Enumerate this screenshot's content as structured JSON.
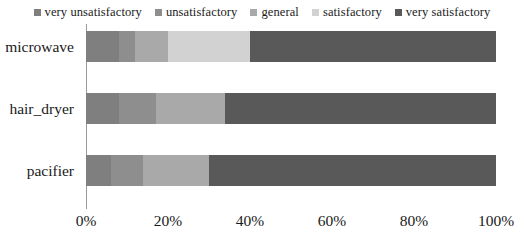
{
  "chart_data": {
    "type": "bar",
    "orientation": "horizontal",
    "stacked": true,
    "normalized": true,
    "title": "",
    "xlabel": "",
    "ylabel": "",
    "xlim": [
      0,
      100
    ],
    "grid": false,
    "legend_position": "top",
    "categories": [
      "microwave",
      "hair_dryer",
      "pacifier"
    ],
    "tick_labels": [
      "0%",
      "20%",
      "40%",
      "60%",
      "80%",
      "100%"
    ],
    "tick_values": [
      0,
      20,
      40,
      60,
      80,
      100
    ],
    "series": [
      {
        "name": "very unsatisfactory",
        "color": "#7f7f7f",
        "values": [
          8,
          8,
          6
        ]
      },
      {
        "name": "unsatisfactory",
        "color": "#8e8e8e",
        "values": [
          4,
          9,
          8
        ]
      },
      {
        "name": "general",
        "color": "#a9a9a9",
        "values": [
          8,
          17,
          16
        ]
      },
      {
        "name": "satisfactory",
        "color": "#d2d2d2",
        "values": [
          20,
          0,
          0
        ]
      },
      {
        "name": "very satisfactory",
        "color": "#595959",
        "values": [
          60,
          66,
          70
        ]
      }
    ]
  },
  "axis": {
    "line_color": "#9a9a9a"
  }
}
